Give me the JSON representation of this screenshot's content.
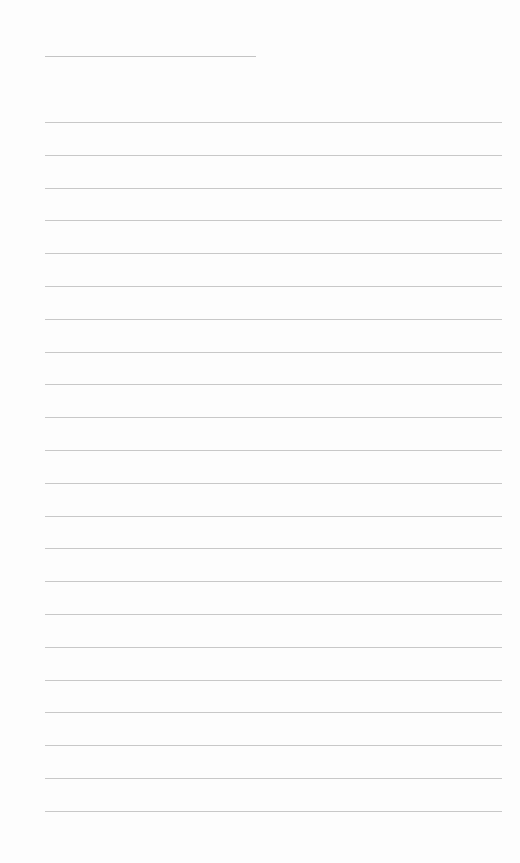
{
  "page": {
    "background_color": "#fdfdfd",
    "line_color": "#c8c8c8",
    "title_line": {
      "present": true
    },
    "ruled_lines": {
      "count": 22,
      "spacing_px": 32.8
    }
  }
}
